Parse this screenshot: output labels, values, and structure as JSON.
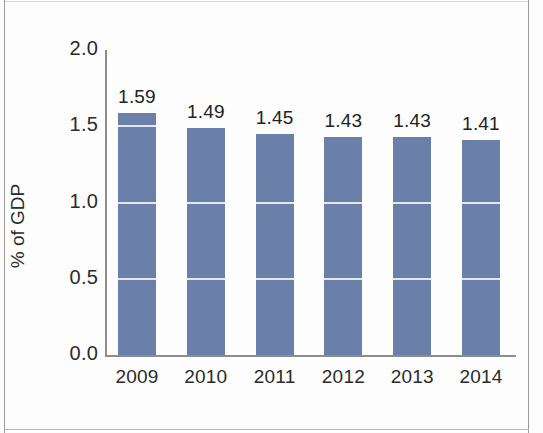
{
  "chart_data": {
    "type": "bar",
    "title": "",
    "subtitle": "",
    "xlabel": "",
    "ylabel": "% of GDP",
    "categories": [
      "2009",
      "2010",
      "2011",
      "2012",
      "2013",
      "2014"
    ],
    "values": [
      1.59,
      1.49,
      1.45,
      1.43,
      1.43,
      1.41
    ],
    "value_labels": [
      "1.59",
      "1.49",
      "1.45",
      "1.43",
      "1.43",
      "1.41"
    ],
    "ylim": [
      0.0,
      2.0
    ],
    "ytick_labels": [
      "0.0",
      "0.5",
      "1.0",
      "1.5",
      "2.0"
    ],
    "ytick_values": [
      0.0,
      0.5,
      1.0,
      1.5,
      2.0
    ],
    "grid": true,
    "grid_axis": "y",
    "grid_over_bars_only": true,
    "legend": false,
    "legend_position": "none",
    "series": [
      {
        "name": "% of GDP",
        "values": [
          1.59,
          1.49,
          1.45,
          1.43,
          1.43,
          1.41
        ],
        "color": "#6b80a9"
      }
    ],
    "colors": {
      "bar": "#6b80a9",
      "gridline": "#eef1f6",
      "axis": "#8d8d8d",
      "text": "#2b2b2b",
      "background": "#fdfdfd",
      "frame": "#9a9a9a"
    }
  }
}
